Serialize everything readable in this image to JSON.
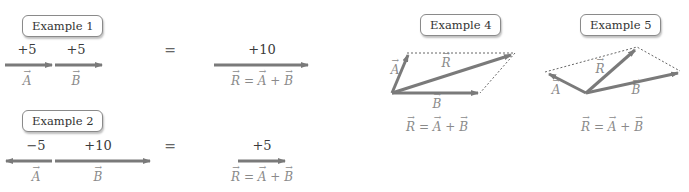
{
  "colors": {
    "arrow": "#7a7a7a",
    "dotted": "#666666",
    "text": "#3a3a3a",
    "vector_label": "#8a8a8a"
  },
  "examples": [
    {
      "id": 1,
      "label": "Example 1",
      "vectors": [
        {
          "name": "A",
          "value": "+5",
          "direction": "right"
        },
        {
          "name": "B",
          "value": "+5",
          "direction": "right"
        }
      ],
      "equals": "=",
      "result": {
        "value": "+10",
        "equation": "R = A + B"
      }
    },
    {
      "id": 2,
      "label": "Example 2",
      "vectors": [
        {
          "name": "A",
          "value": "−5",
          "direction": "left"
        },
        {
          "name": "B",
          "value": "+10",
          "direction": "right"
        }
      ],
      "equals": "=",
      "result": {
        "value": "+5",
        "equation": "R = A + B"
      }
    },
    {
      "id": 4,
      "label": "Example 4",
      "vectors": [
        {
          "name": "A"
        },
        {
          "name": "B"
        },
        {
          "name": "R"
        }
      ],
      "method": "parallelogram",
      "equation": "R = A + B"
    },
    {
      "id": 5,
      "label": "Example 5",
      "vectors": [
        {
          "name": "A"
        },
        {
          "name": "B"
        },
        {
          "name": "R"
        }
      ],
      "method": "parallelogram",
      "equation": "R = A + B"
    }
  ],
  "eq_parts": {
    "R": "R",
    "A": "A",
    "B": "B",
    "equals": "=",
    "plus": "+"
  }
}
